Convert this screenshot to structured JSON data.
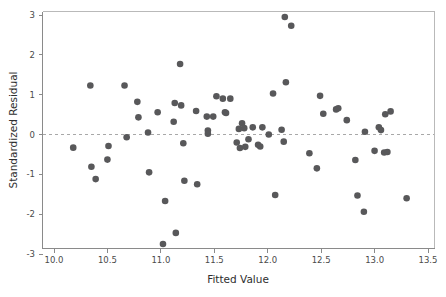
{
  "chart_data": {
    "type": "scatter",
    "title": "",
    "xlabel": "Fitted Value",
    "ylabel": "Standardized Residual",
    "xlim": [
      9.95,
      13.55
    ],
    "ylim": [
      -3.2,
      3.2
    ],
    "xticks": [
      "10.0",
      "10.5",
      "11.0",
      "11.5",
      "12.0",
      "12.5",
      "13.0",
      "13.5"
    ],
    "xtick_values": [
      10.0,
      10.5,
      11.0,
      11.5,
      12.0,
      12.5,
      13.0,
      13.5
    ],
    "yticks": [
      "3",
      "2",
      "1",
      "0",
      "-1",
      "-2",
      "-3"
    ],
    "ytick_values": [
      3,
      2,
      1,
      0,
      -1,
      -2,
      -3
    ],
    "grid": false,
    "legend": false,
    "reference_line": {
      "axis": "y",
      "value": 0,
      "style": "dashed",
      "color": "#a8a8a8"
    },
    "marker": {
      "shape": "circle",
      "color": "#58585a",
      "size": 4.2
    },
    "point_count": 76,
    "x": [
      10.18,
      10.34,
      10.35,
      10.39,
      10.45,
      10.5,
      10.51,
      10.66,
      10.68,
      10.78,
      10.78,
      10.79,
      10.88,
      10.89,
      10.9,
      11.02,
      11.04,
      11.12,
      11.13,
      11.14,
      11.18,
      11.19,
      11.21,
      11.21,
      11.22,
      11.33,
      11.34,
      11.43,
      11.44,
      11.44,
      11.49,
      11.52,
      11.53,
      11.58,
      11.6,
      11.61,
      11.65,
      11.68,
      11.71,
      11.73,
      11.74,
      11.76,
      11.78,
      11.79,
      11.8,
      11.82,
      11.83,
      11.86,
      11.91,
      11.93,
      11.94,
      11.95,
      12.01,
      12.04,
      12.05,
      12.07,
      12.13,
      12.15,
      12.16,
      12.17,
      12.22,
      12.39,
      12.46,
      12.49,
      12.52,
      12.64,
      12.66,
      12.67,
      12.74,
      12.82,
      12.84,
      12.9,
      12.91,
      13.0,
      13.04,
      13.06,
      13.09,
      13.1,
      13.12,
      13.15,
      13.3
    ],
    "y": [
      -0.33,
      1.23,
      -0.81,
      -1.12,
      -0.29,
      -0.63,
      -0.29,
      1.23,
      -0.07,
      0.82,
      0.43,
      -0.07,
      0.05,
      -0.95,
      0.56,
      -2.75,
      0.05,
      0.32,
      0.79,
      -2.47,
      -1.16,
      0.73,
      -0.22,
      -1.16,
      0.73,
      0.59,
      -1.25,
      0.45,
      0.1,
      0.02,
      0.45,
      0.96,
      0.45,
      0.9,
      0.56,
      0.54,
      0.9,
      0.9,
      -0.2,
      0.14,
      -0.34,
      0.28,
      0.16,
      -0.31,
      -0.12,
      0.16,
      -0.12,
      0.18,
      -0.26,
      -0.3,
      -0.3,
      0.18,
      0.0,
      1.03,
      1.03,
      -1.52,
      0.12,
      -0.18,
      2.95,
      1.31,
      2.73,
      -0.47,
      -0.85,
      0.97,
      0.52,
      0.63,
      0.66,
      0.63,
      0.36,
      -0.64,
      -1.53,
      -1.94,
      0.07,
      -0.41,
      0.18,
      0.11,
      -0.45,
      0.51,
      -0.44,
      0.58,
      -1.6
    ],
    "points": [
      {
        "x": 10.18,
        "y": -0.33
      },
      {
        "x": 10.34,
        "y": 1.23
      },
      {
        "x": 10.35,
        "y": -0.81
      },
      {
        "x": 10.39,
        "y": -1.12
      },
      {
        "x": 10.5,
        "y": -0.63
      },
      {
        "x": 10.51,
        "y": -0.29
      },
      {
        "x": 10.66,
        "y": 1.23
      },
      {
        "x": 10.68,
        "y": -0.07
      },
      {
        "x": 10.78,
        "y": 0.82
      },
      {
        "x": 10.79,
        "y": 0.43
      },
      {
        "x": 10.88,
        "y": 0.05
      },
      {
        "x": 10.89,
        "y": -0.95
      },
      {
        "x": 10.97,
        "y": 0.56
      },
      {
        "x": 11.02,
        "y": -2.75
      },
      {
        "x": 11.04,
        "y": -1.67
      },
      {
        "x": 11.12,
        "y": 0.32
      },
      {
        "x": 11.13,
        "y": 0.79
      },
      {
        "x": 11.14,
        "y": -2.47
      },
      {
        "x": 11.18,
        "y": 1.77
      },
      {
        "x": 11.19,
        "y": 0.73
      },
      {
        "x": 11.21,
        "y": -0.22
      },
      {
        "x": 11.22,
        "y": -1.16
      },
      {
        "x": 11.33,
        "y": 0.59
      },
      {
        "x": 11.34,
        "y": -1.25
      },
      {
        "x": 11.43,
        "y": 0.45
      },
      {
        "x": 11.44,
        "y": 0.1
      },
      {
        "x": 11.44,
        "y": 0.02
      },
      {
        "x": 11.49,
        "y": 0.45
      },
      {
        "x": 11.52,
        "y": 0.96
      },
      {
        "x": 11.58,
        "y": 0.9
      },
      {
        "x": 11.6,
        "y": 0.56
      },
      {
        "x": 11.61,
        "y": 0.54
      },
      {
        "x": 11.65,
        "y": 0.9
      },
      {
        "x": 11.71,
        "y": -0.2
      },
      {
        "x": 11.73,
        "y": 0.14
      },
      {
        "x": 11.74,
        "y": -0.34
      },
      {
        "x": 11.76,
        "y": 0.28
      },
      {
        "x": 11.78,
        "y": 0.16
      },
      {
        "x": 11.79,
        "y": -0.31
      },
      {
        "x": 11.82,
        "y": -0.12
      },
      {
        "x": 11.86,
        "y": 0.18
      },
      {
        "x": 11.91,
        "y": -0.26
      },
      {
        "x": 11.93,
        "y": -0.3
      },
      {
        "x": 11.95,
        "y": 0.18
      },
      {
        "x": 12.01,
        "y": 0.0
      },
      {
        "x": 12.05,
        "y": 1.03
      },
      {
        "x": 12.07,
        "y": -1.52
      },
      {
        "x": 12.13,
        "y": 0.12
      },
      {
        "x": 12.15,
        "y": -0.18
      },
      {
        "x": 12.16,
        "y": 2.95
      },
      {
        "x": 12.17,
        "y": 1.31
      },
      {
        "x": 12.22,
        "y": 2.73
      },
      {
        "x": 12.39,
        "y": -0.47
      },
      {
        "x": 12.46,
        "y": -0.85
      },
      {
        "x": 12.49,
        "y": 0.97
      },
      {
        "x": 12.52,
        "y": 0.52
      },
      {
        "x": 12.64,
        "y": 0.63
      },
      {
        "x": 12.66,
        "y": 0.66
      },
      {
        "x": 12.74,
        "y": 0.36
      },
      {
        "x": 12.82,
        "y": -0.64
      },
      {
        "x": 12.84,
        "y": -1.53
      },
      {
        "x": 12.9,
        "y": -1.94
      },
      {
        "x": 12.91,
        "y": 0.07
      },
      {
        "x": 13.0,
        "y": -0.41
      },
      {
        "x": 13.04,
        "y": 0.18
      },
      {
        "x": 13.06,
        "y": 0.11
      },
      {
        "x": 13.09,
        "y": -0.45
      },
      {
        "x": 13.1,
        "y": 0.51
      },
      {
        "x": 13.12,
        "y": -0.44
      },
      {
        "x": 13.15,
        "y": 0.58
      },
      {
        "x": 13.3,
        "y": -1.6
      }
    ]
  },
  "colors": {
    "marker": "#58585a",
    "axis": "#8a8a8a",
    "frame": "#b9b9b9",
    "zero_line": "#a8a8a8",
    "text": "#2e2e2e",
    "tick_text": "#4a4a4a",
    "background": "#ffffff"
  }
}
